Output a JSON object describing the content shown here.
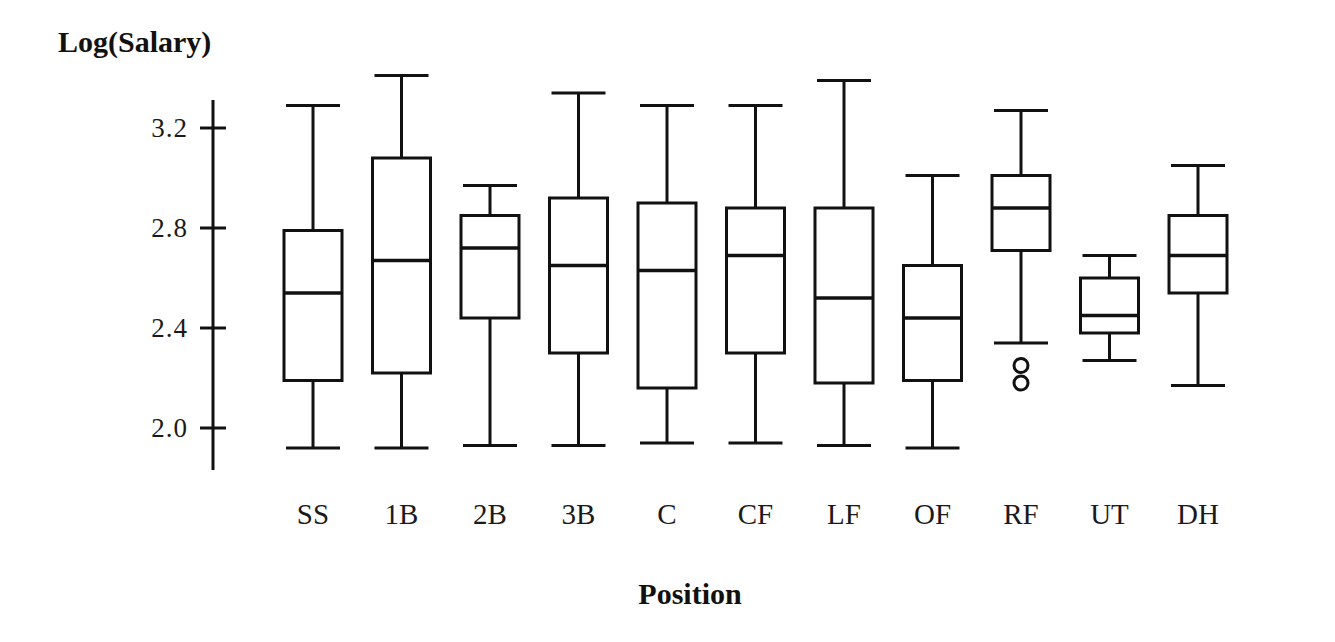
{
  "chart_data": {
    "type": "box",
    "title": "",
    "xlabel": "Position",
    "ylabel": "Log(Salary)",
    "categories": [
      "SS",
      "1B",
      "2B",
      "3B",
      "C",
      "CF",
      "LF",
      "OF",
      "RF",
      "UT",
      "DH"
    ],
    "ytick_labels": [
      "3.2",
      "2.8",
      "2.4",
      "2.0"
    ],
    "ytick_values": [
      3.2,
      2.8,
      2.4,
      2.0
    ],
    "ylim": [
      1.83,
      3.4
    ],
    "grid": false,
    "legend": null,
    "boxes": [
      {
        "category": "SS",
        "whisker_low": 1.92,
        "q1": 2.19,
        "median": 2.54,
        "q3": 2.79,
        "whisker_high": 3.29,
        "outliers": []
      },
      {
        "category": "1B",
        "whisker_low": 1.92,
        "q1": 2.22,
        "median": 2.67,
        "q3": 3.08,
        "whisker_high": 3.41,
        "outliers": []
      },
      {
        "category": "2B",
        "whisker_low": 1.93,
        "q1": 2.44,
        "median": 2.72,
        "q3": 2.85,
        "whisker_high": 2.97,
        "outliers": []
      },
      {
        "category": "3B",
        "whisker_low": 1.93,
        "q1": 2.3,
        "median": 2.65,
        "q3": 2.92,
        "whisker_high": 3.34,
        "outliers": []
      },
      {
        "category": "C",
        "whisker_low": 1.94,
        "q1": 2.16,
        "median": 2.63,
        "q3": 2.9,
        "whisker_high": 3.29,
        "outliers": []
      },
      {
        "category": "CF",
        "whisker_low": 1.94,
        "q1": 2.3,
        "median": 2.69,
        "q3": 2.88,
        "whisker_high": 3.29,
        "outliers": []
      },
      {
        "category": "LF",
        "whisker_low": 1.93,
        "q1": 2.18,
        "median": 2.52,
        "q3": 2.88,
        "whisker_high": 3.39,
        "outliers": []
      },
      {
        "category": "OF",
        "whisker_low": 1.92,
        "q1": 2.19,
        "median": 2.44,
        "q3": 2.65,
        "whisker_high": 3.01,
        "outliers": []
      },
      {
        "category": "RF",
        "whisker_low": 2.34,
        "q1": 2.71,
        "median": 2.88,
        "q3": 3.01,
        "whisker_high": 3.27,
        "outliers": [
          2.25,
          2.18
        ]
      },
      {
        "category": "UT",
        "whisker_low": 2.27,
        "q1": 2.38,
        "median": 2.45,
        "q3": 2.6,
        "whisker_high": 2.69,
        "outliers": []
      },
      {
        "category": "DH",
        "whisker_low": 2.17,
        "q1": 2.54,
        "median": 2.69,
        "q3": 2.85,
        "whisker_high": 3.05,
        "outliers": []
      }
    ]
  },
  "style": {
    "line_color": "#111111",
    "box_fill": "#ffffff",
    "background": "#ffffff"
  }
}
